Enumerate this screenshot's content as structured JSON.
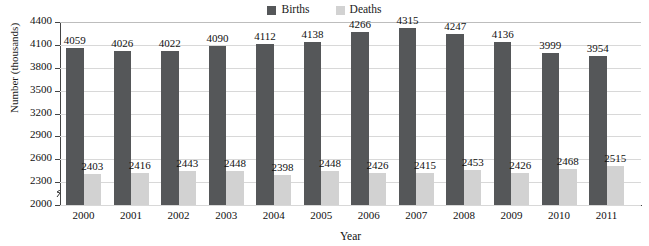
{
  "chart_data": {
    "type": "bar",
    "title": "",
    "xlabel": "Year",
    "ylabel": "Number (thousands)",
    "categories": [
      "2000",
      "2001",
      "2002",
      "2003",
      "2004",
      "2005",
      "2006",
      "2007",
      "2008",
      "2009",
      "2010",
      "2011"
    ],
    "series": [
      {
        "name": "Births",
        "color": "#555759",
        "values": [
          4059,
          4026,
          4022,
          4090,
          4112,
          4138,
          4266,
          4315,
          4247,
          4136,
          3999,
          3954
        ]
      },
      {
        "name": "Deaths",
        "color": "#d2d2d2",
        "values": [
          2403,
          2416,
          2443,
          2448,
          2398,
          2448,
          2426,
          2415,
          2453,
          2426,
          2468,
          2515
        ]
      }
    ],
    "ylim": [
      2000,
      4400
    ],
    "yticks": [
      2000,
      2300,
      2600,
      2900,
      3200,
      3500,
      3800,
      4100,
      4400
    ],
    "ytick_labels": [
      "2000",
      "2300",
      "2600",
      "2900",
      "3200",
      "3500",
      "3800",
      "4100",
      "4400"
    ],
    "grid": true,
    "axis_break": true,
    "legend_position": "top-center",
    "data_labels": true
  }
}
